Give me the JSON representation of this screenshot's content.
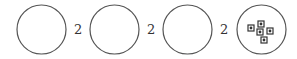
{
  "diagram": {
    "circles": [
      {
        "cx": 41.5,
        "cy": 29.5,
        "r": 24.5,
        "contents": "empty"
      },
      {
        "cx": 114.5,
        "cy": 29.5,
        "r": 24.5,
        "contents": "empty"
      },
      {
        "cx": 187.5,
        "cy": 29.5,
        "r": 24.5,
        "contents": "empty"
      },
      {
        "cx": 261.5,
        "cy": 29.5,
        "r": 24.5,
        "contents": "5 square dots"
      }
    ],
    "labels": [
      {
        "text": "2",
        "x": 74,
        "y": 23
      },
      {
        "text": "2",
        "x": 147,
        "y": 23
      },
      {
        "text": "2",
        "x": 220,
        "y": 23
      }
    ],
    "dots": [
      {
        "x": 251,
        "y": 28
      },
      {
        "x": 261,
        "y": 24
      },
      {
        "x": 260,
        "y": 32
      },
      {
        "x": 270,
        "y": 31
      },
      {
        "x": 264,
        "y": 40
      }
    ],
    "colors": {
      "stroke": "#555555",
      "dot": "#333333"
    }
  }
}
